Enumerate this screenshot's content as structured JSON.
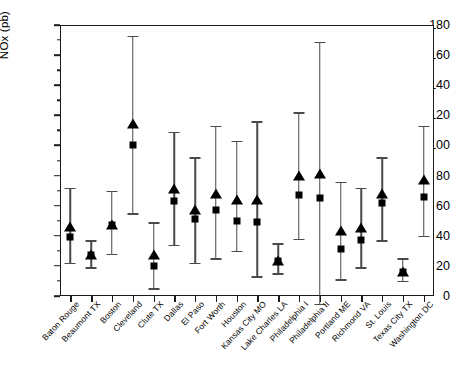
{
  "chart_data": {
    "type": "scatter",
    "title": "",
    "xlabel": "",
    "ylabel": "NOx (pb)",
    "ylim": [
      0,
      180
    ],
    "ytick_step": 20,
    "yticks": [
      0,
      20,
      40,
      60,
      80,
      100,
      120,
      140,
      160,
      180
    ],
    "ytick_labels": [
      "0",
      "20",
      "40",
      "60",
      "80",
      "100",
      "120",
      "140",
      "160",
      "180"
    ],
    "minor_ticks": true,
    "grid": false,
    "legend": "none",
    "categories": [
      "Baton Rouge",
      "Beaumont TX",
      "Boston",
      "Cleveland",
      "Clute TX",
      "Dallas",
      "El Paso",
      "Fort Worth",
      "Houston",
      "Kansas City MO",
      "Lake Charles LA",
      "Philadelphia I",
      "Philadelphia II",
      "Portland ME",
      "Richmond VA",
      "St. Louis",
      "Texas City TX",
      "Washington DC"
    ],
    "series": [
      {
        "name": "triangle",
        "marker": "triangle",
        "values": [
          46,
          27,
          47,
          114,
          27,
          71,
          57,
          68,
          64,
          64,
          23,
          80,
          81,
          43,
          45,
          68,
          16,
          77
        ]
      },
      {
        "name": "square",
        "marker": "square",
        "values": [
          39,
          27,
          47,
          100,
          20,
          63,
          51,
          57,
          50,
          49,
          23,
          67,
          65,
          31,
          37,
          62,
          16,
          66
        ]
      }
    ],
    "error_bars": {
      "lower": [
        22,
        19,
        28,
        55,
        5,
        34,
        22,
        25,
        30,
        13,
        15,
        38,
        -5,
        11,
        19,
        37,
        10,
        40
      ],
      "upper": [
        72,
        37,
        70,
        173,
        49,
        109,
        92,
        113,
        103,
        116,
        35,
        122,
        169,
        76,
        72,
        92,
        25,
        113
      ]
    },
    "annotations": {
      "note": "Each city shows a filled triangle and a filled square marker with a vertical whisker range bar; Philadelphia II whisker extends below the x-axis baseline."
    }
  }
}
